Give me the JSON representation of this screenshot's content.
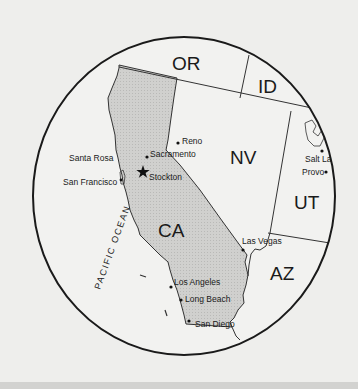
{
  "map": {
    "colors": {
      "background": "#eeeeec",
      "land": "#f2f2f0",
      "highlight_state": "#cfcfcd",
      "border": "#333333",
      "circle": "#1a1a1a"
    },
    "states": [
      {
        "abbr": "OR",
        "name": "Oregon"
      },
      {
        "abbr": "ID",
        "name": "Idaho"
      },
      {
        "abbr": "NV",
        "name": "Nevada"
      },
      {
        "abbr": "UT",
        "name": "Utah"
      },
      {
        "abbr": "CA",
        "name": "California",
        "highlighted": true
      },
      {
        "abbr": "AZ",
        "name": "Arizona"
      }
    ],
    "water_label": "PACIFIC OCEAN",
    "cities": [
      {
        "name": "Reno",
        "marker": "dot"
      },
      {
        "name": "Sacramento",
        "marker": "dot"
      },
      {
        "name": "Santa Rosa",
        "marker": "none"
      },
      {
        "name": "San Francisco",
        "marker": "dot"
      },
      {
        "name": "Stockton",
        "marker": "star"
      },
      {
        "name": "Salt La",
        "marker": "dot"
      },
      {
        "name": "Provo",
        "marker": "dot"
      },
      {
        "name": "Las Vegas",
        "marker": "dot"
      },
      {
        "name": "Los Angeles",
        "marker": "dot"
      },
      {
        "name": "Long Beach",
        "marker": "dot"
      },
      {
        "name": "San Diego",
        "marker": "dot"
      }
    ]
  }
}
